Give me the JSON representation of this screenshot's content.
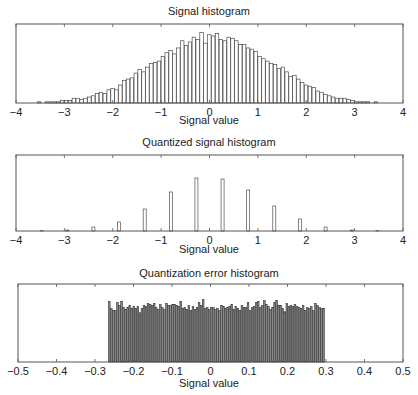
{
  "chart_data": [
    {
      "type": "bar",
      "title": "Signal histogram",
      "xlabel": "Signal value",
      "ylabel": "",
      "xlim": [
        -4,
        4
      ],
      "xticks": [
        "-4",
        "-3",
        "-2",
        "-1",
        "0",
        "1",
        "2",
        "3",
        "4"
      ],
      "bar_fill": "#ffffff",
      "bar_stroke": "#333333",
      "bin_width": 0.08,
      "x": [
        -3.6,
        -3.52,
        -3.44,
        -3.36,
        -3.28,
        -3.2,
        -3.12,
        -3.04,
        -2.96,
        -2.88,
        -2.8,
        -2.72,
        -2.64,
        -2.56,
        -2.48,
        -2.4,
        -2.32,
        -2.24,
        -2.16,
        -2.08,
        -2.0,
        -1.92,
        -1.84,
        -1.76,
        -1.68,
        -1.6,
        -1.52,
        -1.44,
        -1.36,
        -1.28,
        -1.2,
        -1.12,
        -1.04,
        -0.96,
        -0.88,
        -0.8,
        -0.72,
        -0.64,
        -0.56,
        -0.48,
        -0.4,
        -0.32,
        -0.24,
        -0.16,
        -0.08,
        0.0,
        0.08,
        0.16,
        0.24,
        0.32,
        0.4,
        0.48,
        0.56,
        0.64,
        0.72,
        0.8,
        0.88,
        0.96,
        1.04,
        1.12,
        1.2,
        1.28,
        1.36,
        1.44,
        1.52,
        1.6,
        1.68,
        1.76,
        1.84,
        1.92,
        2.0,
        2.08,
        2.16,
        2.24,
        2.32,
        2.4,
        2.48,
        2.56,
        2.64,
        2.72,
        2.8,
        2.88,
        2.96,
        3.04,
        3.12,
        3.2,
        3.28,
        3.36,
        3.44,
        3.52,
        3.6
      ],
      "values": [
        0,
        1,
        0,
        1,
        1,
        1,
        1,
        2,
        2,
        2,
        4,
        4,
        3,
        4,
        5,
        6,
        8,
        9,
        8,
        11,
        12,
        11,
        15,
        19,
        20,
        21,
        25,
        28,
        26,
        30,
        33,
        34,
        35,
        39,
        42,
        44,
        41,
        46,
        52,
        48,
        51,
        55,
        53,
        59,
        50,
        57,
        56,
        58,
        53,
        52,
        55,
        54,
        52,
        49,
        49,
        46,
        45,
        43,
        39,
        37,
        35,
        33,
        32,
        29,
        30,
        26,
        22,
        23,
        20,
        17,
        15,
        14,
        13,
        10,
        9,
        7,
        6,
        5,
        4,
        4,
        4,
        3,
        2,
        1,
        1,
        1,
        1,
        0,
        1,
        0,
        0
      ],
      "ylim": [
        0,
        66
      ]
    },
    {
      "type": "bar",
      "title": "Quantized signal histogram",
      "xlabel": "Signal value",
      "ylabel": "",
      "xlim": [
        -4,
        4
      ],
      "xticks": [
        "-4",
        "-3",
        "-2",
        "-1",
        "0",
        "1",
        "2",
        "3",
        "4"
      ],
      "bar_fill": "#ffffff",
      "bar_stroke": "#333333",
      "bin_width": 0.08,
      "x": [
        -3.47,
        -2.94,
        -2.4,
        -1.87,
        -1.34,
        -0.8,
        -0.27,
        0.27,
        0.8,
        1.34,
        1.87,
        2.4,
        2.94,
        3.47
      ],
      "values": [
        0.3,
        1,
        4,
        9,
        22,
        39,
        53,
        52,
        41,
        25,
        12,
        4,
        1,
        0.3
      ],
      "ylim": [
        0,
        76
      ]
    },
    {
      "type": "bar",
      "title": "Quantization error histogram",
      "xlabel": "Signal value",
      "ylabel": "",
      "xlim": [
        -0.5,
        0.5
      ],
      "xticks": [
        "-0.5",
        "-0.4",
        "-0.3",
        "-0.2",
        "-0.1",
        "0",
        "0.1",
        "0.2",
        "0.3",
        "0.4",
        "0.5"
      ],
      "bar_fill": "#8a8a8a",
      "bar_stroke": "#333333",
      "bin_width": 0.0053,
      "x_start": -0.265,
      "values": [
        59,
        52,
        50,
        50,
        58,
        55,
        59,
        53,
        51,
        53,
        55,
        52,
        54,
        52,
        54,
        48,
        52,
        55,
        54,
        57,
        56,
        55,
        57,
        53,
        51,
        56,
        53,
        51,
        57,
        55,
        55,
        56,
        56,
        55,
        54,
        59,
        52,
        53,
        51,
        55,
        50,
        54,
        51,
        53,
        58,
        55,
        61,
        52,
        53,
        51,
        53,
        53,
        51,
        52,
        50,
        55,
        54,
        52,
        53,
        54,
        56,
        51,
        54,
        52,
        50,
        55,
        53,
        53,
        58,
        50,
        53,
        54,
        58,
        59,
        53,
        55,
        60,
        56,
        54,
        51,
        53,
        58,
        60,
        55,
        55,
        52,
        49,
        57,
        54,
        55,
        54,
        56,
        54,
        53,
        52,
        55,
        50,
        53,
        52,
        54,
        50,
        57,
        55,
        53,
        52,
        52
      ],
      "ylim": [
        0,
        76
      ]
    }
  ],
  "panels": [
    {
      "title": "Signal histogram",
      "xlabel": "Signal value"
    },
    {
      "title": "Quantized signal histogram",
      "xlabel": "Signal value"
    },
    {
      "title": "Quantization error histogram",
      "xlabel": "Signal value"
    }
  ]
}
